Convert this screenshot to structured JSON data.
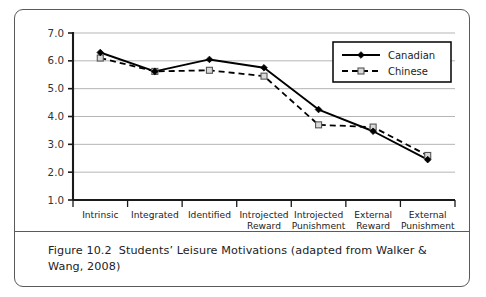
{
  "figure": {
    "caption_label": "Figure 10.2",
    "caption_text": "Students’ Leisure Motivations (adapted from Walker & Wang, 2008)"
  },
  "colors": {
    "frame_border": "#5a5a5a",
    "axis": "#1a1a1a",
    "gridline": "#b5b5b5",
    "canadian_line": "#000000",
    "chinese_line": "#000000",
    "chinese_marker_fill": "#d9d9d9",
    "background": "#ffffff",
    "text": "#222222"
  },
  "chart_data": {
    "type": "line",
    "title": "",
    "xlabel": "",
    "ylabel": "",
    "ylim": [
      1.0,
      7.0
    ],
    "ytick_step": 1.0,
    "ytick_labels": [
      "7.0",
      "6.0",
      "5.0",
      "4.0",
      "3.0",
      "2.0",
      "1.0"
    ],
    "ytick_values": [
      7.0,
      6.0,
      5.0,
      4.0,
      3.0,
      2.0,
      1.0
    ],
    "grid": true,
    "grid_axis": "y",
    "legend_position": "top-right",
    "categories": [
      "Intrinsic",
      "Integrated",
      "Identified",
      "Introjected Reward",
      "Introjected Punishment",
      "External Reward",
      "External Punishment"
    ],
    "category_lines": [
      [
        "Intrinsic"
      ],
      [
        "Integrated"
      ],
      [
        "Identified"
      ],
      [
        "Introjected",
        "Reward"
      ],
      [
        "Introjected",
        "Punishment"
      ],
      [
        "External",
        "Reward"
      ],
      [
        "External",
        "Punishment"
      ]
    ],
    "series": [
      {
        "name": "Canadian",
        "style": "solid",
        "marker": "filled-diamond",
        "values": [
          6.3,
          5.62,
          6.05,
          5.75,
          4.25,
          3.47,
          2.45
        ]
      },
      {
        "name": "Chinese",
        "style": "dashed",
        "marker": "open-square",
        "values": [
          6.1,
          5.62,
          5.66,
          5.45,
          3.7,
          3.62,
          2.6
        ]
      }
    ]
  }
}
